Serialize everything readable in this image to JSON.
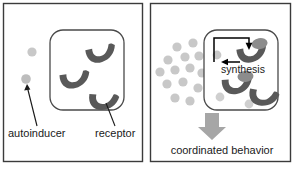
{
  "figure": {
    "title_visible": false,
    "panels": [
      {
        "id": "low-density",
        "labels": {
          "autoinducer": "autoinducer",
          "receptor": "receptor"
        }
      },
      {
        "id": "high-density",
        "labels": {
          "synthesis": "synthesis",
          "coordinated_behavior": "coordinated behavior"
        }
      }
    ]
  },
  "colors": {
    "background": "#ffffff",
    "frame_stroke": "#3b3b3b",
    "cell_stroke": "#4a4a4a",
    "receptor_fill": "#595959",
    "receptor_cap": "#8c8c8c",
    "autoinducer_fill": "#c8c8c8",
    "autoinducer_fill_dark": "#bdbdbd",
    "arrow_gray": "#999999",
    "text": "#1a1a1a"
  },
  "left_panel": {
    "autoinducers_outside": [
      {
        "cx": 32,
        "cy": 52,
        "r": 4.6
      },
      {
        "cx": 26,
        "cy": 79,
        "r": 4.8
      }
    ],
    "receptors": [
      {
        "cx": 101,
        "cy": 52,
        "rot": -12
      },
      {
        "cx": 75,
        "cy": 78,
        "rot": -8
      },
      {
        "cx": 104,
        "cy": 100,
        "rot": 4
      }
    ],
    "cell": {
      "x": 50,
      "y": 30,
      "w": 74,
      "h": 80,
      "r": 13
    },
    "autoinducer_label": {
      "x": 8,
      "y": 136,
      "text_anchor": "start"
    },
    "receptor_label": {
      "x": 97,
      "y": 136,
      "text_anchor": "start"
    }
  },
  "right_panel": {
    "autoinducers_outside": [
      {
        "cx": 177,
        "cy": 47,
        "r": 4.6
      },
      {
        "cx": 193,
        "cy": 43,
        "r": 4.6
      },
      {
        "cx": 168,
        "cy": 60,
        "r": 4.6
      },
      {
        "cx": 185,
        "cy": 57,
        "r": 4.6
      },
      {
        "cx": 199,
        "cy": 56,
        "r": 4.6
      },
      {
        "cx": 160,
        "cy": 72,
        "r": 4.6
      },
      {
        "cx": 175,
        "cy": 70,
        "r": 4.6
      },
      {
        "cx": 190,
        "cy": 68,
        "r": 4.6
      },
      {
        "cx": 202,
        "cy": 73,
        "r": 4.6
      },
      {
        "cx": 167,
        "cy": 84,
        "r": 4.6
      },
      {
        "cx": 183,
        "cy": 82,
        "r": 4.6
      },
      {
        "cx": 198,
        "cy": 88,
        "r": 4.6
      },
      {
        "cx": 175,
        "cy": 98,
        "r": 4.6
      },
      {
        "cx": 190,
        "cy": 101,
        "r": 4.6
      }
    ],
    "autoinducers_inside": [
      {
        "cx": 217,
        "cy": 55,
        "r": 4.4
      },
      {
        "cx": 246,
        "cy": 58,
        "r": 4.4
      },
      {
        "cx": 220,
        "cy": 97,
        "r": 4.4
      },
      {
        "cx": 249,
        "cy": 104,
        "r": 4.4
      }
    ],
    "receptors": [
      {
        "cx": 252,
        "cy": 50,
        "rot": -10,
        "bound": true
      },
      {
        "cx": 237,
        "cy": 82,
        "rot": -4,
        "bound": true
      },
      {
        "cx": 264,
        "cy": 94,
        "rot": 10,
        "bound": false
      }
    ],
    "cell": {
      "x": 204,
      "y": 30,
      "w": 74,
      "h": 80,
      "r": 13
    },
    "synthesis_label": {
      "x": 242,
      "y": 72
    },
    "coordinated_label": {
      "x": 222,
      "y": 152
    },
    "down_arrow": {
      "x": 212,
      "y": 112
    }
  }
}
